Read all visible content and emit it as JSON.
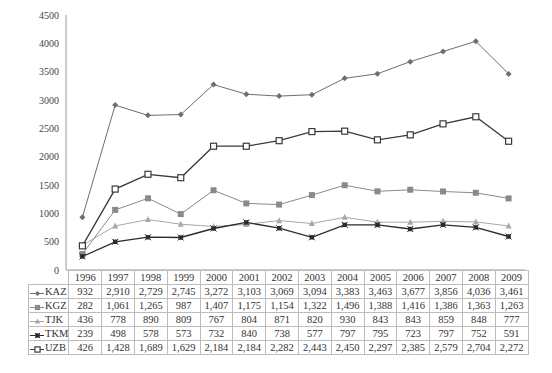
{
  "chart_data": {
    "type": "line",
    "title": "",
    "xlabel": "",
    "ylabel": "",
    "ylim": [
      0,
      4500
    ],
    "yticks": [
      0,
      500,
      1000,
      1500,
      2000,
      2500,
      3000,
      3500,
      4000,
      4500
    ],
    "grid": false,
    "legend_position": "data-table",
    "categories": [
      "1996",
      "1997",
      "1998",
      "1999",
      "2000",
      "2001",
      "2002",
      "2003",
      "2004",
      "2005",
      "2006",
      "2007",
      "2008",
      "2009"
    ],
    "series": [
      {
        "name": "KAZ",
        "marker": "diamond",
        "color": "#6e6e6e",
        "values": [
          932,
          2910,
          2729,
          2745,
          3272,
          3103,
          3069,
          3094,
          3383,
          3463,
          3677,
          3856,
          4036,
          3461
        ],
        "labels": [
          "932",
          "2,910",
          "2,729",
          "2,745",
          "3,272",
          "3,103",
          "3,069",
          "3,094",
          "3,383",
          "3,463",
          "3,677",
          "3,856",
          "4,036",
          "3,461"
        ]
      },
      {
        "name": "KGZ",
        "marker": "square-filled",
        "color": "#8a8a8a",
        "values": [
          282,
          1061,
          1265,
          987,
          1407,
          1175,
          1154,
          1322,
          1496,
          1388,
          1416,
          1386,
          1363,
          1263
        ],
        "labels": [
          "282",
          "1,061",
          "1,265",
          "987",
          "1,407",
          "1,175",
          "1,154",
          "1,322",
          "1,496",
          "1,388",
          "1,416",
          "1,386",
          "1,363",
          "1,263"
        ]
      },
      {
        "name": "TJK",
        "marker": "triangle",
        "color": "#a8a8a8",
        "values": [
          436,
          778,
          890,
          809,
          767,
          804,
          871,
          820,
          930,
          843,
          843,
          859,
          848,
          777
        ],
        "labels": [
          "436",
          "778",
          "890",
          "809",
          "767",
          "804",
          "871",
          "820",
          "930",
          "843",
          "843",
          "859",
          "848",
          "777"
        ]
      },
      {
        "name": "TKM",
        "marker": "star",
        "color": "#2b2b2b",
        "values": [
          239,
          498,
          578,
          573,
          732,
          840,
          738,
          577,
          797,
          795,
          723,
          797,
          752,
          591
        ],
        "labels": [
          "239",
          "498",
          "578",
          "573",
          "732",
          "840",
          "738",
          "577",
          "797",
          "795",
          "723",
          "797",
          "752",
          "591"
        ]
      },
      {
        "name": "UZB",
        "marker": "square-open",
        "color": "#3a3a3a",
        "values": [
          426,
          1428,
          1689,
          1629,
          2184,
          2184,
          2282,
          2443,
          2450,
          2297,
          2385,
          2579,
          2704,
          2272
        ],
        "labels": [
          "426",
          "1,428",
          "1,689",
          "1,629",
          "2,184",
          "2,184",
          "2,282",
          "2,443",
          "2,450",
          "2,297",
          "2,385",
          "2,579",
          "2,704",
          "2,272"
        ]
      }
    ]
  }
}
